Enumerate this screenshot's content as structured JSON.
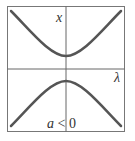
{
  "diagram": {
    "y_axis_label": "x",
    "x_axis_label": "λ",
    "caption_var": "a",
    "caption_rest": " < 0",
    "colors": {
      "curve": "#555555",
      "axis": "#666666",
      "frame": "#777777",
      "background": "#ffffff"
    }
  }
}
